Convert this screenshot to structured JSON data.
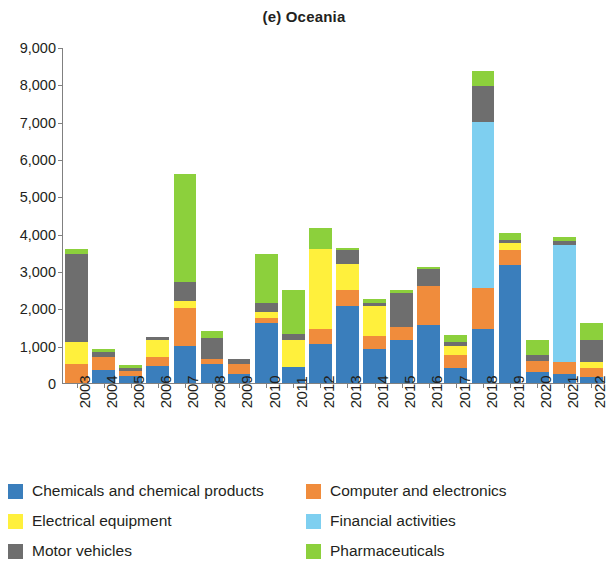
{
  "chart_data": {
    "type": "bar",
    "stacked": true,
    "title": "(e) Oceania",
    "xlabel": "",
    "ylabel": "",
    "ylim": [
      0,
      9000
    ],
    "y_ticks": [
      0,
      1000,
      2000,
      3000,
      4000,
      5000,
      6000,
      7000,
      8000,
      9000
    ],
    "y_tick_labels": [
      "0",
      "1,000",
      "2,000",
      "3,000",
      "4,000",
      "5,000",
      "6,000",
      "7,000",
      "8,000",
      "9,000"
    ],
    "grid": false,
    "legend_position": "bottom",
    "categories": [
      "2003",
      "2004",
      "2005",
      "2006",
      "2007",
      "2008",
      "2009",
      "2010",
      "2011",
      "2012",
      "2013",
      "2014",
      "2015",
      "2016",
      "2017",
      "2018",
      "2019",
      "2020",
      "2021",
      "2022"
    ],
    "series": [
      {
        "name": "Chemicals and chemical products",
        "color": "#3a7ebc",
        "values": [
          0,
          350,
          180,
          450,
          1000,
          500,
          250,
          1600,
          440,
          1050,
          2050,
          900,
          1150,
          1550,
          400,
          1450,
          3150,
          300,
          250,
          150
        ]
      },
      {
        "name": "Computer and electronics",
        "color": "#f08c3c",
        "values": [
          500,
          350,
          140,
          250,
          1000,
          150,
          250,
          150,
          0,
          400,
          450,
          350,
          350,
          1050,
          350,
          1100,
          400,
          300,
          300,
          250
        ]
      },
      {
        "name": "Electrical equipment",
        "color": "#fff03c",
        "values": [
          600,
          0,
          0,
          450,
          200,
          0,
          0,
          150,
          710,
          2150,
          700,
          800,
          0,
          0,
          250,
          0,
          200,
          0,
          0,
          150
        ]
      },
      {
        "name": "Financial activities",
        "color": "#7ecff0",
        "values": [
          0,
          0,
          0,
          0,
          0,
          0,
          0,
          0,
          0,
          0,
          0,
          0,
          0,
          0,
          0,
          4450,
          0,
          0,
          3150,
          0
        ]
      },
      {
        "name": "Motor vehicles",
        "color": "#6e6e6e",
        "values": [
          2350,
          120,
          90,
          80,
          500,
          550,
          150,
          250,
          150,
          0,
          350,
          100,
          900,
          450,
          100,
          950,
          70,
          150,
          100,
          600
        ]
      },
      {
        "name": "Pharmaceuticals",
        "color": "#8cd03c",
        "values": [
          150,
          80,
          60,
          0,
          2900,
          200,
          0,
          1300,
          1200,
          550,
          70,
          100,
          100,
          50,
          180,
          400,
          200,
          400,
          100,
          450
        ]
      }
    ]
  },
  "legend": {
    "items": [
      {
        "label": "Chemicals and chemical products",
        "color": "#3a7ebc",
        "icon": "color-swatch-icon"
      },
      {
        "label": "Computer and electronics",
        "color": "#f08c3c",
        "icon": "color-swatch-icon"
      },
      {
        "label": "Electrical equipment",
        "color": "#fff03c",
        "icon": "color-swatch-icon"
      },
      {
        "label": "Financial activities",
        "color": "#7ecff0",
        "icon": "color-swatch-icon"
      },
      {
        "label": "Motor vehicles",
        "color": "#6e6e6e",
        "icon": "color-swatch-icon"
      },
      {
        "label": "Pharmaceuticals",
        "color": "#8cd03c",
        "icon": "color-swatch-icon"
      }
    ],
    "order": [
      0,
      1,
      2,
      3,
      4,
      5
    ]
  }
}
